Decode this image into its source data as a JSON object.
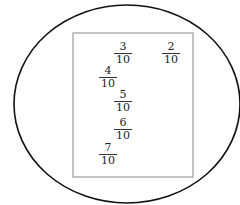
{
  "diagram": {
    "type": "set-venn",
    "outer_shape": "ellipse",
    "inner_shape": "rectangle",
    "fractions": [
      {
        "id": "f1",
        "numerator": "3",
        "denominator": "10",
        "x": 114,
        "y": 42
      },
      {
        "id": "f2",
        "numerator": "2",
        "denominator": "10",
        "x": 162,
        "y": 42
      },
      {
        "id": "f3",
        "numerator": "4",
        "denominator": "10",
        "x": 99,
        "y": 66
      },
      {
        "id": "f4",
        "numerator": "5",
        "denominator": "10",
        "x": 114,
        "y": 90
      },
      {
        "id": "f5",
        "numerator": "6",
        "denominator": "10",
        "x": 114,
        "y": 118
      },
      {
        "id": "f6",
        "numerator": "7",
        "denominator": "10",
        "x": 99,
        "y": 143
      }
    ]
  }
}
